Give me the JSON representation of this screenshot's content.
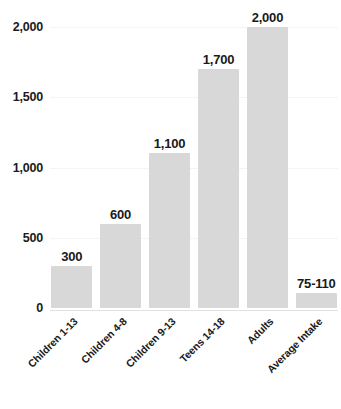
{
  "chart_data": {
    "type": "bar",
    "title": "",
    "subtitle": "",
    "xlabel": "",
    "ylabel": "",
    "categories": [
      "Children 1-13",
      "Children 4-8",
      "Children 9-13",
      "Teens 14-18",
      "Adults",
      "Average Intake"
    ],
    "values": [
      300,
      600,
      1100,
      1700,
      2000,
      107
    ],
    "data_labels": [
      "300",
      "600",
      "1,100",
      "1,700",
      "2,000",
      "75-110"
    ],
    "ylim": [
      0,
      2000
    ],
    "yticks": [
      0,
      500,
      1000,
      1500,
      2000
    ],
    "ytick_labels": [
      "0",
      "500",
      "1,000",
      "1,500",
      "2,000"
    ],
    "grid": true,
    "legend": false,
    "bar_color": "#d8d8d8",
    "text_color": "#1a1a1a",
    "gridline_color": "#f4f4f4",
    "baseline_color": "#e2e2e2"
  }
}
